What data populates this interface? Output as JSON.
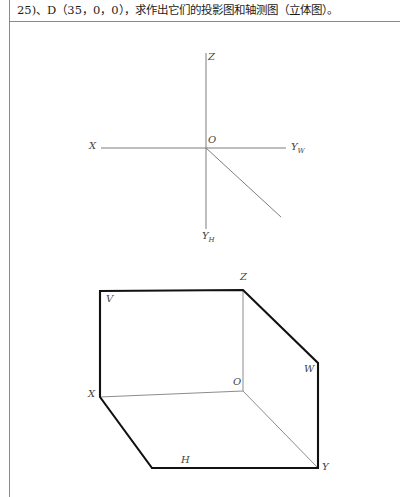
{
  "page": {
    "header_text": "25)、D（35，0，0），求作出它们的投影图和轴测图（立体图）。",
    "background_color": "#ffffff",
    "frame_color": "#8a8a8a",
    "ink_color": "#111111",
    "thin_line_color": "#8c8c8c",
    "axis_line_color": "#7d7d7d",
    "label_color": "#444444"
  },
  "projection_axes": {
    "title": "three-axis projection system",
    "origin_label": "O",
    "axes": [
      {
        "name": "z-axis",
        "label": "Z",
        "label_x": 208,
        "label_y": 56,
        "x1": 206,
        "y1": 53,
        "x2": 206,
        "y2": 148
      },
      {
        "name": "x-axis",
        "label": "X",
        "label_x": 90,
        "label_y": 142,
        "x1": 101,
        "y1": 148,
        "x2": 206,
        "y2": 148
      },
      {
        "name": "yw-axis",
        "label": "Y",
        "sub": "W",
        "label_x": 290,
        "label_y": 142,
        "x1": 206,
        "y1": 148,
        "x2": 286,
        "y2": 148
      },
      {
        "name": "yh-axis",
        "label": "Y",
        "sub": "H",
        "label_x": 201,
        "label_y": 231,
        "x1": 206,
        "y1": 148,
        "x2": 281,
        "y2": 217
      },
      {
        "name": "z-axis-lower",
        "label": "",
        "x1": 206,
        "y1": 148,
        "x2": 206,
        "y2": 229
      }
    ],
    "origin_label_x": 207,
    "origin_label_y": 135
  },
  "axonometric_box": {
    "title": "axonometric projection box (立体图)",
    "vertices": {
      "Z": {
        "x": 243,
        "y": 290
      },
      "V_top_left": {
        "x": 100,
        "y": 291
      },
      "X": {
        "x": 100,
        "y": 397
      },
      "O": {
        "x": 243,
        "y": 391
      },
      "W_top": {
        "x": 318,
        "y": 363
      },
      "Y": {
        "x": 318,
        "y": 468
      },
      "H_bottom_left": {
        "x": 152,
        "y": 468
      }
    },
    "labels": [
      {
        "name": "label-V",
        "text": "V",
        "x": 106,
        "y": 295
      },
      {
        "name": "label-Z",
        "text": "Z",
        "x": 240,
        "y": 273
      },
      {
        "name": "label-W",
        "text": "W",
        "x": 305,
        "y": 365
      },
      {
        "name": "label-X",
        "text": "X",
        "x": 89,
        "y": 390
      },
      {
        "name": "label-O",
        "text": "O",
        "x": 233,
        "y": 378
      },
      {
        "name": "label-H",
        "text": "H",
        "x": 181,
        "y": 456
      },
      {
        "name": "label-Y",
        "text": "Y",
        "x": 322,
        "y": 463
      }
    ],
    "thick_outline_path": "M100,291 L243,290 L318,363 L318,468 L152,468 L100,397 Z",
    "thin_edges": [
      {
        "name": "edge-Z-O",
        "x1": 243,
        "y1": 290,
        "x2": 243,
        "y2": 391
      },
      {
        "name": "edge-X-O",
        "x1": 100,
        "y1": 397,
        "x2": 243,
        "y2": 391
      },
      {
        "name": "edge-O-Y",
        "x1": 243,
        "y1": 391,
        "x2": 318,
        "y2": 468
      }
    ]
  }
}
